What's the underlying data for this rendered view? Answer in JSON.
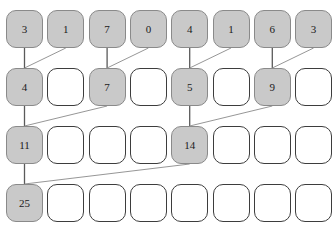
{
  "diagram": {
    "title_sliver": "∙ ∙ ∙ ∙ ∙ ∙ ∙ ∙ ∙",
    "columns": 8,
    "rows": 4,
    "colors": {
      "filled_fill": "#c9c9c9",
      "filled_border": "#8a8a8a",
      "empty_fill": "#ffffff",
      "empty_border": "#3d3d3d",
      "edge_vertical": "#5a5a5a",
      "edge_diagonal": "#8a8a8a",
      "text": "#1a1a1a",
      "background": "#ffffff"
    },
    "geometry": {
      "cell_width": 37,
      "cell_height": 38,
      "col_pitch": 41.3,
      "x_origin": 6,
      "row_y": [
        10,
        68,
        126,
        184
      ]
    },
    "rows_data": [
      {
        "index": 0,
        "cells": [
          {
            "value": "3",
            "filled": true
          },
          {
            "value": "1",
            "filled": true
          },
          {
            "value": "7",
            "filled": true
          },
          {
            "value": "0",
            "filled": true
          },
          {
            "value": "4",
            "filled": true
          },
          {
            "value": "1",
            "filled": true
          },
          {
            "value": "6",
            "filled": true
          },
          {
            "value": "3",
            "filled": true
          }
        ]
      },
      {
        "index": 1,
        "cells": [
          {
            "value": "4",
            "filled": true
          },
          {
            "value": "",
            "filled": false
          },
          {
            "value": "7",
            "filled": true
          },
          {
            "value": "",
            "filled": false
          },
          {
            "value": "5",
            "filled": true
          },
          {
            "value": "",
            "filled": false
          },
          {
            "value": "9",
            "filled": true
          },
          {
            "value": "",
            "filled": false
          }
        ]
      },
      {
        "index": 2,
        "cells": [
          {
            "value": "11",
            "filled": true
          },
          {
            "value": "",
            "filled": false
          },
          {
            "value": "",
            "filled": false
          },
          {
            "value": "",
            "filled": false
          },
          {
            "value": "14",
            "filled": true
          },
          {
            "value": "",
            "filled": false
          },
          {
            "value": "",
            "filled": false
          },
          {
            "value": "",
            "filled": false
          }
        ]
      },
      {
        "index": 3,
        "cells": [
          {
            "value": "25",
            "filled": true
          },
          {
            "value": "",
            "filled": false
          },
          {
            "value": "",
            "filled": false
          },
          {
            "value": "",
            "filled": false
          },
          {
            "value": "",
            "filled": false
          },
          {
            "value": "",
            "filled": false
          },
          {
            "value": "",
            "filled": false
          },
          {
            "value": "",
            "filled": false
          }
        ]
      }
    ],
    "edges": [
      {
        "from_row": 0,
        "from_col": 0,
        "to_row": 1,
        "to_col": 0,
        "kind": "vertical"
      },
      {
        "from_row": 0,
        "from_col": 1,
        "to_row": 1,
        "to_col": 0,
        "kind": "diagonal"
      },
      {
        "from_row": 0,
        "from_col": 2,
        "to_row": 1,
        "to_col": 2,
        "kind": "vertical"
      },
      {
        "from_row": 0,
        "from_col": 3,
        "to_row": 1,
        "to_col": 2,
        "kind": "diagonal"
      },
      {
        "from_row": 0,
        "from_col": 4,
        "to_row": 1,
        "to_col": 4,
        "kind": "vertical"
      },
      {
        "from_row": 0,
        "from_col": 5,
        "to_row": 1,
        "to_col": 4,
        "kind": "diagonal"
      },
      {
        "from_row": 0,
        "from_col": 6,
        "to_row": 1,
        "to_col": 6,
        "kind": "vertical"
      },
      {
        "from_row": 0,
        "from_col": 7,
        "to_row": 1,
        "to_col": 6,
        "kind": "diagonal"
      },
      {
        "from_row": 1,
        "from_col": 0,
        "to_row": 2,
        "to_col": 0,
        "kind": "vertical"
      },
      {
        "from_row": 1,
        "from_col": 2,
        "to_row": 2,
        "to_col": 0,
        "kind": "diagonal"
      },
      {
        "from_row": 1,
        "from_col": 4,
        "to_row": 2,
        "to_col": 4,
        "kind": "vertical"
      },
      {
        "from_row": 1,
        "from_col": 6,
        "to_row": 2,
        "to_col": 4,
        "kind": "diagonal"
      },
      {
        "from_row": 2,
        "from_col": 0,
        "to_row": 3,
        "to_col": 0,
        "kind": "vertical"
      },
      {
        "from_row": 2,
        "from_col": 4,
        "to_row": 3,
        "to_col": 0,
        "kind": "diagonal"
      }
    ]
  }
}
